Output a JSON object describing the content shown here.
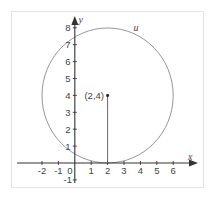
{
  "diagram": {
    "type": "coordinate-plane-circle",
    "axes": {
      "x_label": "x",
      "y_label": "y",
      "x_ticks": [
        "-2",
        "-1",
        "1",
        "2",
        "3",
        "4",
        "5",
        "6"
      ],
      "y_ticks": [
        "1",
        "2",
        "3",
        "4",
        "5",
        "6",
        "7",
        "8"
      ],
      "y_negative_tick": "-1",
      "origin_label": "0"
    },
    "circle": {
      "label": "u",
      "center": [
        2,
        4
      ],
      "radius": 4
    },
    "point": {
      "label": "(2,4)",
      "x": 2,
      "y": 4
    },
    "colors": {
      "axis": "#333333",
      "circle": "#8a8a8a",
      "text": "#444444"
    }
  }
}
